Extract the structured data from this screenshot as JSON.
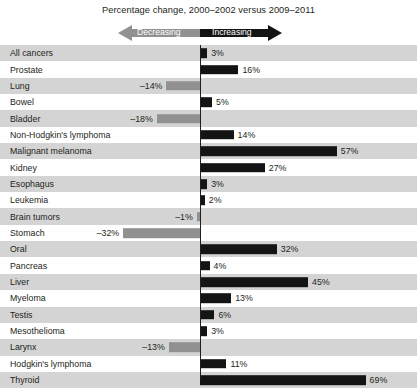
{
  "chart_data": {
    "type": "bar",
    "orientation": "horizontal",
    "title": "Percentage change, 2000–2002 versus 2009–2011",
    "xlabel": "",
    "ylabel": "",
    "grid": false,
    "zero_axis": true,
    "legend_position": "top",
    "legend": [
      {
        "key": "decreasing",
        "label": "Decreasing",
        "color": "#919191",
        "direction": "left"
      },
      {
        "key": "increasing",
        "label": "Increasing",
        "color": "#141414",
        "direction": "right"
      }
    ],
    "value_suffix": "%",
    "xlim": [
      -32,
      69
    ],
    "categories": [
      "All cancers",
      "Prostate",
      "Lung",
      "Bowel",
      "Bladder",
      "Non-Hodgkin's lymphoma",
      "Malignant melanoma",
      "Kidney",
      "Esophagus",
      "Leukemia",
      "Brain tumors",
      "Stomach",
      "Oral",
      "Pancreas",
      "Liver",
      "Myeloma",
      "Testis",
      "Mesothelioma",
      "Larynx",
      "Hodgkin's lymphoma",
      "Thyroid"
    ],
    "values": [
      3,
      16,
      -14,
      5,
      -18,
      14,
      57,
      27,
      3,
      2,
      -1,
      -32,
      32,
      4,
      45,
      13,
      6,
      3,
      -13,
      11,
      69
    ],
    "value_labels": [
      "3%",
      "16%",
      "–14%",
      "5%",
      "–18%",
      "14%",
      "57%",
      "27%",
      "3%",
      "2%",
      "–1%",
      "–32%",
      "32%",
      "4%",
      "45%",
      "13%",
      "6%",
      "3%",
      "–13%",
      "11%",
      "69%"
    ]
  },
  "style": {
    "shaded_row_color": "#d4d4d4",
    "plain_row_color": "#ffffff",
    "positive_bar_color": "#141414",
    "negative_bar_color": "#919191",
    "axis_color": "#231f20",
    "text_color": "#231f20"
  }
}
